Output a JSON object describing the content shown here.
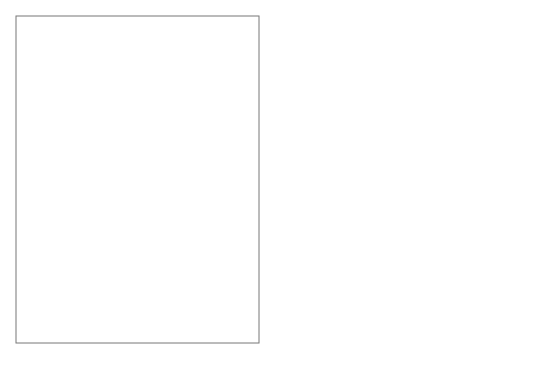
{
  "map": {
    "title": "States with right-to-work laws",
    "colors": {
      "right_to_work": "#8e8e8e",
      "other": "#d9d9d9",
      "border": "#333333",
      "frame": "#777777"
    },
    "state_labels": {
      "WA": "WA",
      "OR": "OR",
      "CA": "CA",
      "ID": "ID",
      "NV": "NV",
      "MT": "MT",
      "WY": "WY",
      "UT": "UT",
      "AZ": "AZ",
      "CO": "CO",
      "NM": "NM",
      "ND": "ND",
      "SD": "SD",
      "NE": "NE",
      "KS": "KS",
      "OK": "OK",
      "TX": "TX",
      "MN": "MN",
      "IA": "IA",
      "MO": "MO",
      "AR": "AR",
      "LA": "LA",
      "WI": "WI",
      "IL": "IL",
      "MI": "MI",
      "IN": "IN",
      "OH": "OH",
      "KY": "KY",
      "TN": "TN",
      "MS": "MS",
      "AL": "AL",
      "GA": "GA",
      "FL": "FL",
      "SC": "SC",
      "NC": "NC",
      "VA": "VA",
      "WV": "WV",
      "PA": "PA",
      "NY": "NY",
      "ME": "ME",
      "Alaska": "Alaska",
      "Hawaii": "Hawaii"
    },
    "right_to_work_states": [
      "ID",
      "NV",
      "UT",
      "AZ",
      "WY",
      "ND",
      "SD",
      "NE",
      "KS",
      "TX",
      "IA",
      "AR",
      "LA",
      "MS",
      "AL",
      "TN",
      "GA",
      "FL",
      "SC",
      "NC",
      "VA"
    ],
    "other_states": [
      "WA",
      "OR",
      "CA",
      "MT",
      "CO",
      "NM",
      "MN",
      "MO",
      "OK",
      "WI",
      "IL",
      "MI",
      "IN",
      "OH",
      "KY",
      "WV",
      "PA",
      "NY",
      "ME",
      "NH",
      "VT",
      "MA",
      "RI",
      "CT",
      "NJ",
      "DE",
      "MD",
      "DC",
      "Alaska",
      "Hawaii"
    ],
    "callouts": {
      "new_hampshire": "New Hampshire",
      "vermont": "Vermont",
      "massachusetts": "Massachusetts",
      "rhode_island": "Rhode Island",
      "connecticut": "Connecticut",
      "new_jersey": "New Jersey",
      "delaware": "Delaware",
      "maryland": "Maryland",
      "district_of_columbia_1": "District of",
      "district_of_columbia_2": "Columbia"
    }
  },
  "legend": {
    "label": "States with right-to-work laws",
    "swatch_color": "#8e8e8e"
  }
}
